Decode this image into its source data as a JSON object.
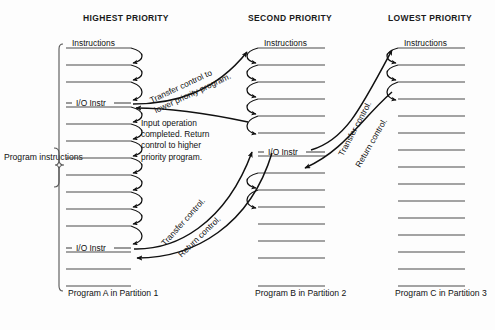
{
  "diagram": {
    "title_row": [
      {
        "id": "col-a",
        "label": "HIGHEST PRIORITY"
      },
      {
        "id": "col-b",
        "label": "SECOND PRIORITY"
      },
      {
        "id": "col-c",
        "label": "LOWEST PRIORITY"
      }
    ],
    "side_label": "Program\ninstructions",
    "columns": [
      {
        "id": "program-a",
        "header_title": "HIGHEST PRIORITY",
        "instructions_label": "Instructions",
        "footer_label": "Program A in\nPartition 1",
        "line_count": 14,
        "io_rows": [
          3,
          11
        ],
        "io_label": "I/O Instr"
      },
      {
        "id": "program-b",
        "header_title": "SECOND PRIORITY",
        "instructions_label": "Instructions",
        "footer_label": "Program B in\nPartition 2",
        "line_count": 14,
        "io_rows": [
          6
        ],
        "io_label": "I/O Instr"
      },
      {
        "id": "program-c",
        "header_title": "LOWEST PRIORITY",
        "instructions_label": "Instructions",
        "footer_label": "Program C in\nPartition 3",
        "line_count": 14,
        "io_rows": [],
        "io_label": "I/O Instr"
      }
    ],
    "annotations": [
      {
        "id": "transfer-ab",
        "text": "Transfer control to\nlower priority program."
      },
      {
        "id": "input-complete",
        "text": "Input operation\ncompleted. Return\ncontrol to higher\npriority program."
      },
      {
        "id": "transfer-a2b",
        "text": "Transfer control."
      },
      {
        "id": "return-b2a",
        "text": "Return control."
      },
      {
        "id": "transfer-b2c",
        "text": "Transfer control."
      },
      {
        "id": "return-c2b",
        "text": "Return control."
      }
    ],
    "colors": {
      "ink": "#111111",
      "rule": "#4a4a4a",
      "background": "#fdfdfd"
    }
  }
}
